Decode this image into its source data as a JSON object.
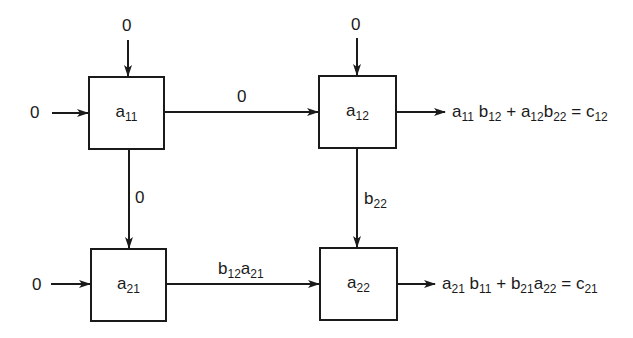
{
  "diagram": {
    "type": "systolic-array",
    "cells": [
      {
        "id": "a11",
        "base": "a",
        "sub": "11"
      },
      {
        "id": "a12",
        "base": "a",
        "sub": "12"
      },
      {
        "id": "a21",
        "base": "a",
        "sub": "21"
      },
      {
        "id": "a22",
        "base": "a",
        "sub": "22"
      }
    ],
    "inputs": {
      "top_a11": "0",
      "top_a12": "0",
      "left_a11": "0",
      "left_a21": "0"
    },
    "edges": {
      "a11_to_a12": {
        "label": "0"
      },
      "a11_to_a21": {
        "label": "0"
      },
      "a12_to_a22": {
        "label_base": "b",
        "label_sub": "22"
      },
      "a21_to_a22": {
        "parts": [
          {
            "base": "b",
            "sub": "12"
          },
          {
            "base": "a",
            "sub": "21"
          }
        ]
      }
    },
    "outputs": {
      "c12": {
        "terms": [
          {
            "base": "a",
            "sub": "11"
          },
          {
            "base": "b",
            "sub": "12"
          },
          {
            "op": " + "
          },
          {
            "base": "a",
            "sub": "12"
          },
          {
            "base": "b",
            "sub": "22"
          },
          {
            "op": " = "
          },
          {
            "base": "c",
            "sub": "12"
          }
        ],
        "text": "a11b12 + a12b22 = c12"
      },
      "c21": {
        "terms": [
          {
            "base": "a",
            "sub": "21"
          },
          {
            "base": "b",
            "sub": "11"
          },
          {
            "op": " + "
          },
          {
            "base": "b",
            "sub": "21"
          },
          {
            "base": "a",
            "sub": "22"
          },
          {
            "op": " = "
          },
          {
            "base": "c",
            "sub": "21"
          }
        ],
        "text": "a21b11 + b21a22 = c21"
      }
    }
  }
}
